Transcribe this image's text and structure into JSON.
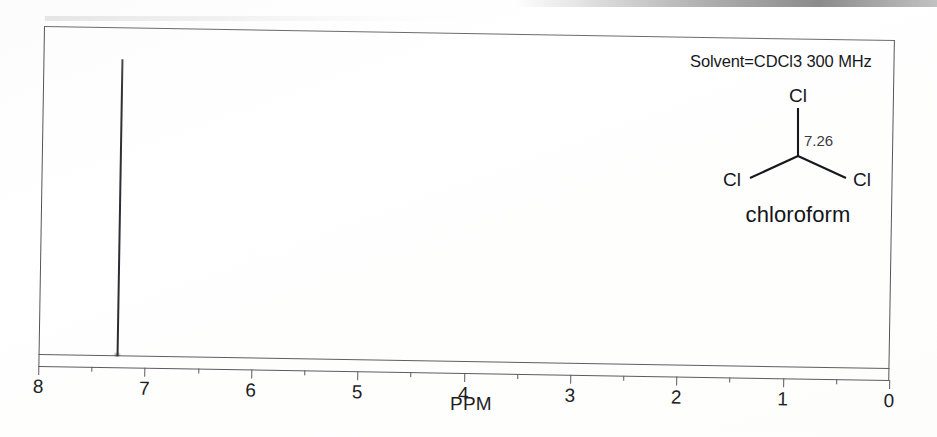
{
  "figure": {
    "annotation": "Solvent=CDCl3 300 MHz"
  },
  "molecule": {
    "atom_top": "Cl",
    "atom_left": "Cl",
    "atom_right": "Cl",
    "shift_label": "7.26",
    "caption": "chloroform"
  },
  "axis": {
    "title": "PPM",
    "tick_labels": [
      "8",
      "7",
      "6",
      "5",
      "4",
      "3",
      "2",
      "1",
      "0"
    ]
  },
  "chart_data": {
    "type": "line",
    "title": "",
    "subtitle": "Solvent=CDCl3 300 MHz",
    "xlabel": "PPM",
    "ylabel": "",
    "xlim": [
      8,
      0
    ],
    "ylim": [
      0,
      1
    ],
    "x_inverted": true,
    "grid": false,
    "legend": "none",
    "x_ticks_major": [
      8,
      7,
      6,
      5,
      4,
      3,
      2,
      1,
      0
    ],
    "x_ticks_minor": [
      7.5,
      6.5,
      5.5,
      4.5,
      3.5,
      2.5,
      1.5,
      0.5
    ],
    "x_tick_labels": [
      "8",
      "7",
      "6",
      "5",
      "4",
      "3",
      "2",
      "1",
      "0"
    ],
    "series": [
      {
        "name": "chloroform 1H",
        "peaks": [
          {
            "shift_ppm": 7.26,
            "relative_height": 0.955,
            "width_ppm": 0.02,
            "multiplicity": "s",
            "assignment": "CHCl3"
          }
        ],
        "baseline": 0.0
      }
    ],
    "annotations": [
      {
        "text": "Solvent=CDCl3 300 MHz",
        "x_ppm": 1.6,
        "y": 0.94
      },
      {
        "text": "7.26",
        "note": "chemical shift label on structure"
      },
      {
        "text": "chloroform",
        "note": "structure caption"
      }
    ]
  }
}
